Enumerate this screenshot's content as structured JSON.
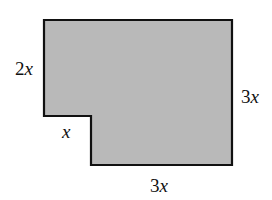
{
  "figure": {
    "shape": "L-shaped polygon (rectangle with lower-left corner notch removed)",
    "fill_color": "#b9b9b9",
    "stroke_color": "#111111",
    "vertices": [
      [
        44,
        20
      ],
      [
        232,
        20
      ],
      [
        232,
        165
      ],
      [
        91,
        165
      ],
      [
        91,
        116
      ],
      [
        44,
        116
      ]
    ],
    "labels": {
      "left_side": {
        "coef": "2",
        "var": "x"
      },
      "right_side": {
        "coef": "3",
        "var": "x"
      },
      "notch_top": {
        "coef": "",
        "var": "x"
      },
      "bottom_side": {
        "coef": "3",
        "var": "x"
      }
    }
  }
}
